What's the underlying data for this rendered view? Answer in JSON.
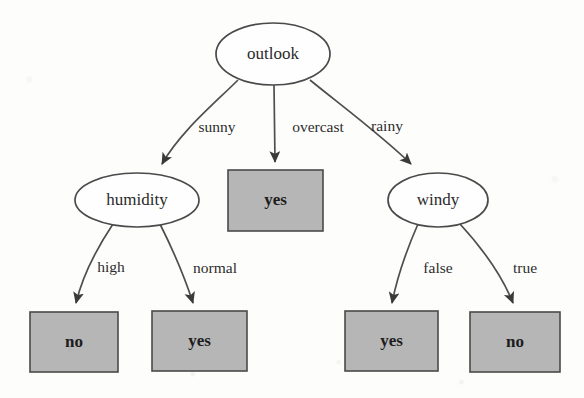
{
  "figure": {
    "kind": "decision-tree-diagram",
    "colors": {
      "background": "#fdfdfc",
      "leaf_fill": "#b6b6b6",
      "node_fill": "#fefefe",
      "stroke": "#4a4a4a",
      "text": "#2a2a2a"
    }
  },
  "tree": {
    "root": {
      "id": "outlook",
      "label": "outlook",
      "shape": "ellipse",
      "cx": 273,
      "cy": 54,
      "rx": 57,
      "ry": 31
    },
    "decision_nodes": [
      {
        "id": "humidity",
        "label": "humidity",
        "shape": "ellipse",
        "cx": 137,
        "cy": 200,
        "rx": 62,
        "ry": 27
      },
      {
        "id": "windy",
        "label": "windy",
        "shape": "ellipse",
        "cx": 438,
        "cy": 200,
        "rx": 50,
        "ry": 27
      }
    ],
    "leaf_nodes": [
      {
        "id": "leaf-overcast-yes",
        "label": "yes",
        "shape": "rect",
        "x": 228,
        "y": 170,
        "width": 95,
        "height": 61
      },
      {
        "id": "leaf-high-no",
        "label": "no",
        "shape": "rect",
        "x": 30,
        "y": 312,
        "width": 88,
        "height": 60
      },
      {
        "id": "leaf-normal-yes",
        "label": "yes",
        "shape": "rect",
        "x": 152,
        "y": 311,
        "width": 95,
        "height": 60
      },
      {
        "id": "leaf-false-yes",
        "label": "yes",
        "shape": "rect",
        "x": 345,
        "y": 311,
        "width": 93,
        "height": 60
      },
      {
        "id": "leaf-true-no",
        "label": "no",
        "shape": "rect",
        "x": 470,
        "y": 312,
        "width": 90,
        "height": 60
      }
    ],
    "edges": [
      {
        "id": "edge-sunny",
        "from": "outlook",
        "to": "humidity",
        "label": "sunny",
        "label_x": 217,
        "label_y": 128,
        "path": "M 238,80 C 215,103 180,132 162,164"
      },
      {
        "id": "edge-overcast",
        "from": "outlook",
        "to": "leaf-overcast-yes",
        "label": "overcast",
        "label_x": 318,
        "label_y": 128,
        "path": "M 274,85 L 275,162"
      },
      {
        "id": "edge-rainy",
        "from": "outlook",
        "to": "windy",
        "label": "rainy",
        "label_x": 387,
        "label_y": 127,
        "path": "M 310,80 C 338,103 380,134 411,164"
      },
      {
        "id": "edge-high",
        "from": "humidity",
        "to": "leaf-high-no",
        "label": "high",
        "label_x": 111,
        "label_y": 268,
        "path": "M 113,224 C 97,248 82,278 76,303"
      },
      {
        "id": "edge-normal",
        "from": "humidity",
        "to": "leaf-normal-yes",
        "label": "normal",
        "label_x": 215,
        "label_y": 269,
        "path": "M 160,224 C 173,250 185,278 193,303"
      },
      {
        "id": "edge-false",
        "from": "windy",
        "to": "leaf-false-yes",
        "label": "false",
        "label_x": 438,
        "label_y": 269,
        "path": "M 418,224 C 407,249 397,278 392,303"
      },
      {
        "id": "edge-true",
        "from": "windy",
        "to": "leaf-true-no",
        "label": "true",
        "label_x": 525,
        "label_y": 269,
        "path": "M 460,224 C 483,249 503,278 513,303"
      }
    ]
  }
}
